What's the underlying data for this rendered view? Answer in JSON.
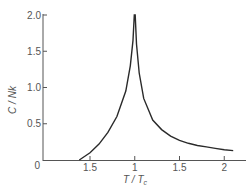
{
  "chart_data": {
    "type": "line",
    "title": "",
    "xlabel": "T / Tc",
    "ylabel": "C / Nk",
    "xlim": [
      0.4,
      2.2
    ],
    "ylim": [
      0,
      2.0
    ],
    "grid": false,
    "legend": null,
    "x_ticks": [
      {
        "value": 0.5,
        "label": "1.5"
      },
      {
        "value": 1.0,
        "label": "1"
      },
      {
        "value": 1.5,
        "label": "1.5"
      },
      {
        "value": 2.0,
        "label": "2"
      }
    ],
    "y_ticks": [
      {
        "value": 0,
        "label": "0"
      },
      {
        "value": 0.5,
        "label": "0.5"
      },
      {
        "value": 1.0,
        "label": "1.0"
      },
      {
        "value": 1.5,
        "label": "1.5"
      },
      {
        "value": 2.0,
        "label": "2.0"
      }
    ],
    "series": [
      {
        "name": "specific heat",
        "x": [
          0.38,
          0.5,
          0.6,
          0.7,
          0.8,
          0.9,
          0.95,
          0.98,
          0.995,
          1.005,
          1.02,
          1.05,
          1.1,
          1.2,
          1.3,
          1.4,
          1.5,
          1.6,
          1.7,
          1.8,
          1.9,
          2.0,
          2.1
        ],
        "y": [
          0.0,
          0.1,
          0.22,
          0.38,
          0.6,
          0.95,
          1.3,
          1.65,
          2.0,
          2.0,
          1.6,
          1.2,
          0.85,
          0.55,
          0.42,
          0.33,
          0.27,
          0.23,
          0.2,
          0.18,
          0.16,
          0.14,
          0.13
        ]
      }
    ]
  },
  "axes": {
    "x_title_main": "T",
    "x_title_sep": " / ",
    "x_title_sub_base": "T",
    "x_title_sub": "c",
    "y_title": "C / Nk"
  },
  "colors": {
    "line": "#2a2a2a",
    "axis": "#555555",
    "text": "#555555"
  }
}
